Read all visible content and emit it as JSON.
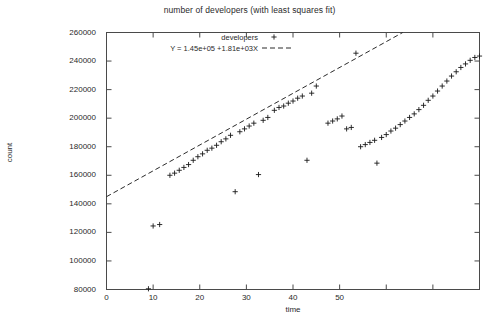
{
  "chart_data": {
    "type": "scatter",
    "title": "number of developers (with least squares fit)",
    "xlabel": "time",
    "ylabel": "count",
    "xlim": [
      0,
      80
    ],
    "ylim": [
      80000,
      260000
    ],
    "grid": false,
    "legend_position": "top-center",
    "xticks": [
      0,
      10,
      20,
      30,
      40,
      50,
      60,
      70,
      80
    ],
    "xtick_labels": [
      "0",
      "10",
      "20",
      "30",
      "40",
      "50",
      "",
      "",
      ""
    ],
    "yticks": [
      80000,
      100000,
      120000,
      140000,
      160000,
      180000,
      200000,
      220000,
      240000,
      260000
    ],
    "ytick_labels": [
      "80000",
      "100000",
      "120000",
      "140000",
      "160000",
      "180000",
      "200000",
      "220000",
      "240000",
      "260000"
    ],
    "series": [
      {
        "name": "developers",
        "marker": "+",
        "type": "scatter",
        "points": [
          [
            9.0,
            80500
          ],
          [
            10.0,
            124500
          ],
          [
            11.4,
            125500
          ],
          [
            13.6,
            160000
          ],
          [
            14.6,
            161500
          ],
          [
            15.6,
            163500
          ],
          [
            16.6,
            165500
          ],
          [
            17.6,
            167500
          ],
          [
            18.6,
            170500
          ],
          [
            19.6,
            173000
          ],
          [
            20.6,
            175000
          ],
          [
            21.6,
            177500
          ],
          [
            22.6,
            179000
          ],
          [
            23.6,
            181000
          ],
          [
            24.6,
            183500
          ],
          [
            25.6,
            185500
          ],
          [
            26.6,
            188000
          ],
          [
            27.6,
            148500
          ],
          [
            28.6,
            190500
          ],
          [
            29.6,
            192500
          ],
          [
            30.6,
            194500
          ],
          [
            31.6,
            196500
          ],
          [
            32.6,
            160500
          ],
          [
            33.6,
            198500
          ],
          [
            34.6,
            200500
          ],
          [
            36.0,
            205500
          ],
          [
            37.0,
            207500
          ],
          [
            38.0,
            208500
          ],
          [
            39.0,
            210500
          ],
          [
            40.0,
            212000
          ],
          [
            41.0,
            214000
          ],
          [
            42.0,
            215500
          ],
          [
            43.0,
            170500
          ],
          [
            44.0,
            217500
          ],
          [
            45.0,
            222500
          ],
          [
            47.5,
            196500
          ],
          [
            48.5,
            198000
          ],
          [
            49.5,
            199500
          ],
          [
            50.5,
            201500
          ],
          [
            51.5,
            192500
          ],
          [
            52.5,
            193500
          ],
          [
            53.5,
            245500
          ],
          [
            54.5,
            180000
          ],
          [
            55.5,
            181500
          ],
          [
            56.5,
            183000
          ],
          [
            57.5,
            184500
          ],
          [
            58.0,
            168500
          ],
          [
            59.0,
            186500
          ],
          [
            60.0,
            188500
          ],
          [
            61.0,
            191000
          ],
          [
            62.0,
            193000
          ],
          [
            63.0,
            195500
          ],
          [
            64.0,
            198000
          ],
          [
            65.0,
            200500
          ],
          [
            66.0,
            203000
          ],
          [
            67.0,
            206000
          ],
          [
            68.0,
            209000
          ],
          [
            69.0,
            212500
          ],
          [
            70.0,
            215500
          ],
          [
            71.0,
            219000
          ],
          [
            72.0,
            222500
          ],
          [
            73.0,
            226000
          ],
          [
            74.0,
            229500
          ],
          [
            75.0,
            232500
          ],
          [
            76.0,
            235500
          ],
          [
            77.0,
            238000
          ],
          [
            78.0,
            240500
          ],
          [
            79.0,
            242500
          ],
          [
            80.0,
            243500
          ]
        ]
      },
      {
        "name": "Y = 1.45e+05 +1.81e+03X",
        "marker": "dashed-line",
        "type": "line",
        "intercept": 145000,
        "slope": 1810,
        "x_start": 0,
        "x_end": 80
      }
    ]
  },
  "legend": {
    "entry_1_label": "developers",
    "entry_1_marker": "+",
    "entry_2_label": "Y = 1.45e+05 +1.81e+03X",
    "entry_2_marker": "dashed-line"
  },
  "axes": {
    "title": "number of developers (with least squares fit)",
    "xlabel": "time",
    "ylabel": "count"
  }
}
